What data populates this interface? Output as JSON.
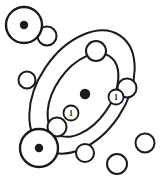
{
  "figure": {
    "canvas": {
      "width": 163,
      "height": 184
    },
    "colors": {
      "stroke": "#1a1a1a",
      "fill": "#ffffff",
      "background": "#ffffff"
    }
  },
  "nucleus": {
    "label": "central-nucleus",
    "cx": 85,
    "cy": 94,
    "r": 5.2
  },
  "orbits": [
    {
      "name": "outer-orbit",
      "cx": 82,
      "cy": 92,
      "rx": 68,
      "ry": 44,
      "rotation": -56,
      "stroke_width": 2.0
    },
    {
      "name": "inner-orbit",
      "cx": 83,
      "cy": 95,
      "rx": 47,
      "ry": 28,
      "rotation": -55,
      "stroke_width": 2.0
    }
  ],
  "atoms": [
    {
      "name": "atom-top-left",
      "cx": 24,
      "cy": 25,
      "r": 18,
      "dot_r": 4.2,
      "stroke_width": 2.4
    },
    {
      "name": "atom-bottom-left",
      "cx": 39,
      "cy": 148,
      "r": 19,
      "dot_r": 4.2,
      "stroke_width": 2.4
    }
  ],
  "electrons": [
    {
      "name": "electron-outer-1",
      "cx": 47,
      "cy": 36,
      "r": 9.5,
      "stroke_width": 2.0
    },
    {
      "name": "electron-outer-2",
      "cx": 96,
      "cy": 51,
      "r": 10.0,
      "stroke_width": 2.0
    },
    {
      "name": "electron-outer-3",
      "cx": 127,
      "cy": 88,
      "r": 9.5,
      "stroke_width": 2.0
    },
    {
      "name": "electron-outer-4",
      "cx": 145,
      "cy": 143,
      "r": 9.5,
      "stroke_width": 2.0
    },
    {
      "name": "electron-outer-5",
      "cx": 117,
      "cy": 164,
      "r": 10.0,
      "stroke_width": 2.0
    },
    {
      "name": "electron-outer-6",
      "cx": 85,
      "cy": 153,
      "r": 9.0,
      "stroke_width": 2.0
    },
    {
      "name": "electron-outer-7",
      "cx": 57,
      "cy": 127,
      "r": 9.5,
      "stroke_width": 2.0
    },
    {
      "name": "electron-outer-8",
      "cx": 27,
      "cy": 80,
      "r": 8.5,
      "stroke_width": 2.0
    }
  ],
  "spin_markers": [
    {
      "name": "spin-marker-left",
      "cx": 71,
      "cy": 113,
      "r": 7.5,
      "label": "1",
      "stroke_width": 1.8
    },
    {
      "name": "spin-marker-right",
      "cx": 116,
      "cy": 97,
      "r": 7.5,
      "label": "1",
      "stroke_width": 1.8
    }
  ]
}
